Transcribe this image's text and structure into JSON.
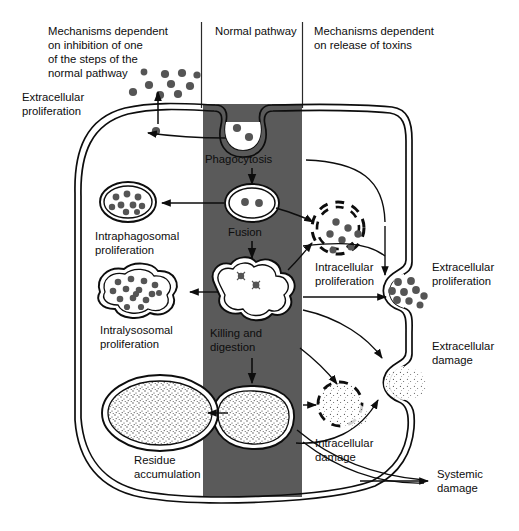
{
  "figure": {
    "type": "biological-pathway-diagram",
    "background_color": "#ffffff",
    "ink_color": "#0d0d0d",
    "band_color": "#5a5a5a",
    "particle_color": "#555555"
  },
  "columns": [
    {
      "id": "left",
      "heading_lines": [
        "Mechanisms dependent",
        "on inhibition of one",
        "of the steps of the",
        "normal pathway"
      ]
    },
    {
      "id": "center",
      "heading_lines": [
        "Normal pathway"
      ]
    },
    {
      "id": "right",
      "heading_lines": [
        "Mechanisms dependent",
        "on release of toxins"
      ]
    }
  ],
  "center_pathway": {
    "steps": [
      {
        "id": "phagocytosis",
        "label_lines": [
          "Phagocytosis"
        ]
      },
      {
        "id": "fusion",
        "label_lines": [
          "Fusion"
        ]
      },
      {
        "id": "killing-digestion",
        "label_lines": [
          "Killing and",
          "digestion"
        ]
      }
    ]
  },
  "left_outcomes": [
    {
      "id": "extracellular-proliferation-left",
      "label_lines": [
        "Extracellular",
        "proliferation"
      ]
    },
    {
      "id": "intraphagosomal-proliferation",
      "label_lines": [
        "Intraphagosomal",
        "proliferation"
      ]
    },
    {
      "id": "intralysosomal-proliferation",
      "label_lines": [
        "Intralysosomal",
        "proliferation"
      ]
    },
    {
      "id": "residue-accumulation",
      "label_lines": [
        "Residue",
        "accumulation"
      ]
    }
  ],
  "right_outcomes": [
    {
      "id": "intracellular-proliferation",
      "label_lines": [
        "Intracellular",
        "proliferation"
      ]
    },
    {
      "id": "extracellular-proliferation-right",
      "label_lines": [
        "Extracellular",
        "proliferation"
      ]
    },
    {
      "id": "extracellular-damage",
      "label_lines": [
        "Extracellular",
        "damage"
      ]
    },
    {
      "id": "intracellular-damage",
      "label_lines": [
        "Intracellular",
        "damage"
      ]
    },
    {
      "id": "systemic-damage",
      "label_lines": [
        "Systemic",
        "damage"
      ]
    }
  ],
  "text": {
    "head_left_1": "Mechanisms dependent",
    "head_left_2": "on inhibition of one",
    "head_left_3": "of the steps of the",
    "head_left_4": "normal pathway",
    "head_center_1": "Normal pathway",
    "head_right_1": "Mechanisms dependent",
    "head_right_2": "on release of toxins",
    "extracellular_proliferation_l1": "Extracellular",
    "extracellular_proliferation_l2": "proliferation",
    "phagocytosis": "Phagocytosis",
    "fusion": "Fusion",
    "intraphagosomal_1": "Intraphagosomal",
    "intraphagosomal_2": "proliferation",
    "intralysosomal_1": "Intralysosomal",
    "intralysosomal_2": "proliferation",
    "killing_1": "Killing and",
    "killing_2": "digestion",
    "residue_1": "Residue",
    "residue_2": "accumulation",
    "intracellular_prolif_1": "Intracellular",
    "intracellular_prolif_2": "proliferation",
    "extracellular_prolif_r1": "Extracellular",
    "extracellular_prolif_r2": "proliferation",
    "extracellular_damage_1": "Extracellular",
    "extracellular_damage_2": "damage",
    "intracellular_damage_1": "Intracellular",
    "intracellular_damage_2": "damage",
    "systemic_damage_1": "Systemic",
    "systemic_damage_2": "damage"
  }
}
